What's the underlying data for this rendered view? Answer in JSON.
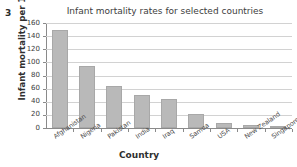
{
  "question_number": "3",
  "chart_data": {
    "type": "bar",
    "title": "Infant mortality rates for selected countries",
    "xlabel": "Country",
    "ylabel": "Infant mortality per 1000",
    "categories": [
      "Afghanistan",
      "Nigeria",
      "Pakistan",
      "India",
      "Iraq",
      "Samoa",
      "USA",
      "New Zealand",
      "Singapore"
    ],
    "values": [
      149,
      94,
      64,
      50,
      44,
      22,
      7,
      5,
      3
    ],
    "ylim": [
      0,
      160
    ],
    "ytick_values": [
      0,
      20,
      40,
      60,
      80,
      100,
      120,
      140,
      160
    ],
    "ytick_labels": [
      "0",
      "20",
      "40",
      "60",
      "80",
      "100",
      "120",
      "140",
      "160"
    ],
    "grid": true,
    "legend": false,
    "bar_color": "#b9b9b9",
    "grid_color": "#d2d2d2",
    "axis_color": "#8a8a8a"
  }
}
